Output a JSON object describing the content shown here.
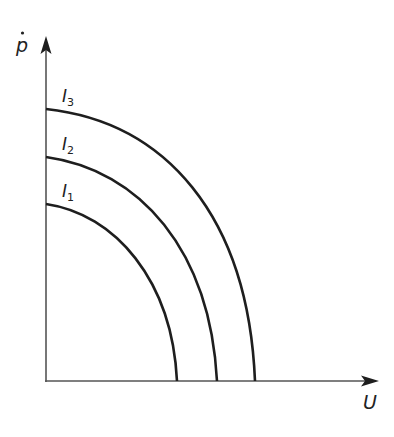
{
  "diagram": {
    "type": "iso-curves",
    "y_axis": {
      "label": "ṗ",
      "label_base": "p",
      "dot": true
    },
    "x_axis": {
      "label": "U"
    },
    "curves": [
      {
        "name": "I",
        "subscript": "1",
        "y_intercept_px": 204,
        "x_intercept_px": 177
      },
      {
        "name": "I",
        "subscript": "2",
        "y_intercept_px": 157,
        "x_intercept_px": 217
      },
      {
        "name": "I",
        "subscript": "3",
        "y_intercept_px": 109,
        "x_intercept_px": 255
      }
    ],
    "colors": {
      "line": "#1e1e1e",
      "axis": "#555555",
      "background": "#ffffff"
    }
  }
}
